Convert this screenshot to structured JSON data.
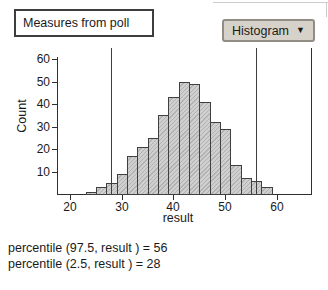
{
  "title_box": {
    "label": "Measures from poll"
  },
  "dropdown": {
    "label": "Histogram",
    "arrow": "▼"
  },
  "chart_data": {
    "type": "bar",
    "subtype": "histogram",
    "title": "",
    "xlabel": "result",
    "ylabel": "Count",
    "x_ticks": [
      20,
      30,
      40,
      50,
      60
    ],
    "y_ticks": [
      10,
      20,
      30,
      40,
      50,
      60
    ],
    "xlim": [
      17.7,
      66.6
    ],
    "ylim": [
      0,
      62
    ],
    "grid": false,
    "legend": "none",
    "bins": {
      "start": 23,
      "width": 2
    },
    "counts": [
      1,
      3,
      5,
      9,
      17,
      21,
      25,
      35,
      43,
      50,
      49,
      41,
      32,
      29,
      13,
      7,
      6,
      3
    ],
    "ref_lines": [
      {
        "x": 28
      },
      {
        "x": 56
      }
    ]
  },
  "stats_lines": [
    "percentile (97.5, result ) = 56",
    "percentile (2.5, result ) = 28"
  ],
  "colors": {
    "bar_fill": "#cfcfcf",
    "bar_hatch": "#b2b2b2",
    "bar_border": "#3f3f3f",
    "axis": "#2f2f2f",
    "ref_line": "#3f3f3f",
    "text": "#1a1a1a",
    "dropdown_bg": "#d6d2c9",
    "dropdown_border": "#918d85",
    "frame": "#cccccc"
  }
}
